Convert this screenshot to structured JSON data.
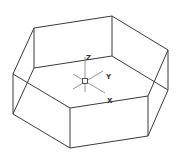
{
  "diagram": {
    "colors": {
      "edge": "#3a3a3a",
      "axis": "#8a8a8a",
      "background": "#ffffff"
    },
    "vertices_top": [
      [
        34,
        28
      ],
      [
        112,
        16
      ],
      [
        168,
        50
      ],
      [
        148,
        96
      ],
      [
        70,
        108
      ],
      [
        13,
        74
      ]
    ],
    "vertices_bottom": [
      [
        34,
        68
      ],
      [
        112,
        56
      ],
      [
        168,
        90
      ],
      [
        148,
        136
      ],
      [
        70,
        148
      ],
      [
        13,
        114
      ]
    ],
    "axis_icon": {
      "icon": "ucs-axis-icon",
      "origin": [
        85,
        81
      ],
      "labels": {
        "z": "Z",
        "y": "Y",
        "x": "X"
      }
    }
  }
}
